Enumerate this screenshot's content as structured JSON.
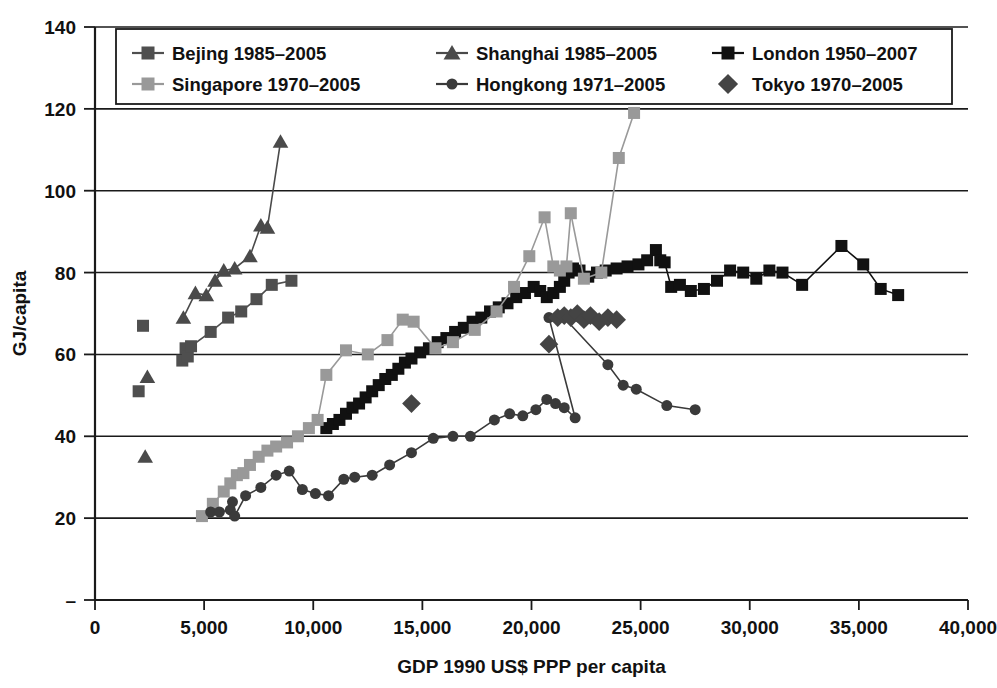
{
  "chart_data": {
    "type": "scatter",
    "title": "",
    "xlabel": "GDP 1990 US$ PPP per capita",
    "ylabel": "GJ/capita",
    "xlim": [
      0,
      40000
    ],
    "ylim": [
      0,
      140
    ],
    "xticks": [
      0,
      5000,
      10000,
      15000,
      20000,
      25000,
      30000,
      35000,
      40000
    ],
    "xticklabels": [
      "0",
      "5,000",
      "10,000",
      "15,000",
      "20,000",
      "25,000",
      "30,000",
      "35,000",
      "40,000"
    ],
    "yticks": [
      0,
      20,
      40,
      60,
      80,
      100,
      120,
      140
    ],
    "yticklabels": [
      "–",
      "20",
      "40",
      "60",
      "80",
      "100",
      "120",
      "140"
    ],
    "grid": "horizontal",
    "legend_position": "top-inside",
    "legend_columns": 3,
    "series": [
      {
        "name": "Bejing 1985–2005",
        "marker": "square",
        "color": "#4f4f4f",
        "line": true,
        "points": [
          [
            2000,
            51.0
          ],
          [
            2200,
            67.0
          ],
          [
            4000,
            58.5
          ],
          [
            4150,
            61.5
          ],
          [
            4250,
            59.5
          ],
          [
            4400,
            62.0
          ],
          [
            5300,
            65.5
          ],
          [
            6100,
            69.0
          ],
          [
            6700,
            70.5
          ],
          [
            7400,
            73.5
          ],
          [
            8100,
            77.0
          ],
          [
            9000,
            78.0
          ]
        ],
        "connected_from_index": 2
      },
      {
        "name": "Shanghai 1985–2005",
        "marker": "triangle",
        "color": "#4a4a4a",
        "line": true,
        "points": [
          [
            2300,
            35.0
          ],
          [
            2400,
            54.5
          ],
          [
            4050,
            69.0
          ],
          [
            4600,
            75.0
          ],
          [
            5100,
            74.5
          ],
          [
            5500,
            78.0
          ],
          [
            5900,
            80.5
          ],
          [
            6400,
            81.0
          ],
          [
            7100,
            84.0
          ],
          [
            7600,
            91.5
          ],
          [
            7900,
            91.0
          ],
          [
            8500,
            112.0
          ]
        ],
        "connected_from_index": 2
      },
      {
        "name": "London 1950–2007",
        "marker": "square",
        "color": "#111111",
        "line": true,
        "points": [
          [
            10600,
            42.0
          ],
          [
            10900,
            43.0
          ],
          [
            11200,
            44.0
          ],
          [
            11500,
            45.5
          ],
          [
            11800,
            47.0
          ],
          [
            12100,
            48.0
          ],
          [
            12400,
            49.5
          ],
          [
            12700,
            51.0
          ],
          [
            13000,
            52.5
          ],
          [
            13300,
            54.0
          ],
          [
            13600,
            55.0
          ],
          [
            13900,
            56.5
          ],
          [
            14200,
            58.0
          ],
          [
            14500,
            59.0
          ],
          [
            14900,
            60.5
          ],
          [
            15300,
            61.5
          ],
          [
            15700,
            63.0
          ],
          [
            16100,
            64.0
          ],
          [
            16500,
            65.5
          ],
          [
            16900,
            66.5
          ],
          [
            17300,
            68.0
          ],
          [
            17700,
            69.0
          ],
          [
            18100,
            70.5
          ],
          [
            18500,
            71.5
          ],
          [
            18900,
            72.5
          ],
          [
            19300,
            74.0
          ],
          [
            19700,
            75.0
          ],
          [
            20100,
            76.5
          ],
          [
            20400,
            75.5
          ],
          [
            20700,
            74.0
          ],
          [
            21000,
            75.0
          ],
          [
            21300,
            76.5
          ],
          [
            21500,
            78.0
          ],
          [
            21700,
            80.0
          ],
          [
            21900,
            81.0
          ],
          [
            22200,
            80.5
          ],
          [
            22600,
            79.0
          ],
          [
            23000,
            80.0
          ],
          [
            23400,
            80.5
          ],
          [
            23900,
            81.0
          ],
          [
            24400,
            81.5
          ],
          [
            24900,
            82.0
          ],
          [
            25300,
            83.0
          ],
          [
            25700,
            85.5
          ],
          [
            25900,
            83.0
          ],
          [
            26100,
            82.5
          ],
          [
            26400,
            76.5
          ],
          [
            26800,
            77.0
          ],
          [
            27300,
            75.5
          ],
          [
            27900,
            76.0
          ],
          [
            28500,
            78.0
          ],
          [
            29100,
            80.5
          ],
          [
            29700,
            80.0
          ],
          [
            30300,
            78.5
          ],
          [
            30900,
            80.5
          ],
          [
            31500,
            80.0
          ],
          [
            32400,
            77.0
          ],
          [
            34200,
            86.5
          ],
          [
            35200,
            82.0
          ],
          [
            36000,
            76.0
          ],
          [
            36800,
            74.5
          ]
        ]
      },
      {
        "name": "Singapore 1970–2005",
        "marker": "square",
        "color": "#999999",
        "line": true,
        "points": [
          [
            4900,
            20.5
          ],
          [
            5400,
            23.5
          ],
          [
            5900,
            26.5
          ],
          [
            6200,
            28.5
          ],
          [
            6500,
            30.5
          ],
          [
            6800,
            31.0
          ],
          [
            7100,
            33.0
          ],
          [
            7500,
            35.0
          ],
          [
            7900,
            36.5
          ],
          [
            8300,
            37.5
          ],
          [
            8800,
            38.5
          ],
          [
            9300,
            40.0
          ],
          [
            9800,
            42.0
          ],
          [
            10200,
            44.0
          ],
          [
            10600,
            55.0
          ],
          [
            11500,
            61.0
          ],
          [
            12500,
            60.0
          ],
          [
            13400,
            63.5
          ],
          [
            14100,
            68.5
          ],
          [
            14600,
            68.0
          ],
          [
            15600,
            61.5
          ],
          [
            16400,
            63.0
          ],
          [
            17400,
            66.0
          ],
          [
            18400,
            70.5
          ],
          [
            19200,
            76.5
          ],
          [
            19900,
            84.0
          ],
          [
            20600,
            93.5
          ],
          [
            21000,
            81.5
          ],
          [
            21300,
            80.5
          ],
          [
            21600,
            81.5
          ],
          [
            21800,
            94.5
          ],
          [
            22400,
            78.5
          ],
          [
            23200,
            80.0
          ],
          [
            24000,
            108.0
          ],
          [
            24700,
            119.0
          ]
        ]
      },
      {
        "name": "Hongkong 1971–2005",
        "marker": "circle",
        "color": "#3a3a3a",
        "line": true,
        "points": [
          [
            5300,
            21.5
          ],
          [
            5700,
            21.5
          ],
          [
            6200,
            22.0
          ],
          [
            6300,
            24.0
          ],
          [
            6400,
            20.5
          ],
          [
            6900,
            25.5
          ],
          [
            7600,
            27.5
          ],
          [
            8300,
            30.5
          ],
          [
            8900,
            31.5
          ],
          [
            9500,
            27.0
          ],
          [
            10100,
            26.0
          ],
          [
            10700,
            25.5
          ],
          [
            11400,
            29.5
          ],
          [
            11900,
            30.0
          ],
          [
            12700,
            30.5
          ],
          [
            13500,
            33.0
          ],
          [
            14500,
            36.0
          ],
          [
            15500,
            39.5
          ],
          [
            16400,
            40.0
          ],
          [
            17200,
            40.0
          ],
          [
            18300,
            44.0
          ],
          [
            19000,
            45.5
          ],
          [
            19600,
            45.0
          ],
          [
            20200,
            46.5
          ],
          [
            20700,
            49.0
          ],
          [
            21100,
            48.0
          ],
          [
            21500,
            47.0
          ],
          [
            22000,
            44.5
          ],
          [
            20800,
            69.0
          ],
          [
            21400,
            69.5
          ],
          [
            23500,
            57.5
          ],
          [
            24200,
            52.5
          ],
          [
            24800,
            51.5
          ],
          [
            26200,
            47.5
          ],
          [
            27500,
            46.5
          ]
        ]
      },
      {
        "name": "Tokyo 1970–2005",
        "marker": "diamond",
        "color": "#444444",
        "line": false,
        "points": [
          [
            14500,
            48.0
          ],
          [
            20800,
            62.5
          ],
          [
            21200,
            69.0
          ],
          [
            21500,
            69.5
          ],
          [
            21800,
            69.0
          ],
          [
            22100,
            70.0
          ],
          [
            22400,
            68.5
          ],
          [
            22700,
            69.5
          ],
          [
            23100,
            68.0
          ],
          [
            23500,
            69.0
          ],
          [
            23900,
            68.5
          ]
        ]
      }
    ]
  },
  "legend": {
    "entries": [
      {
        "label": "Bejing 1985–2005",
        "marker": "square",
        "color": "#4f4f4f",
        "line": true
      },
      {
        "label": "Shanghai 1985–2005",
        "marker": "triangle",
        "color": "#4a4a4a",
        "line": true
      },
      {
        "label": "London 1950–2007",
        "marker": "square",
        "color": "#111111",
        "line": true
      },
      {
        "label": "Singapore 1970–2005",
        "marker": "square",
        "color": "#999999",
        "line": true
      },
      {
        "label": "Hongkong 1971–2005",
        "marker": "circle",
        "color": "#3a3a3a",
        "line": true
      },
      {
        "label": "Tokyo 1970–2005",
        "marker": "diamond",
        "color": "#444444",
        "line": false
      }
    ]
  },
  "colors": {
    "axis": "#1a1a1a",
    "background": "#ffffff",
    "beijing": "#4f4f4f",
    "shanghai": "#4a4a4a",
    "london": "#111111",
    "singapore": "#999999",
    "hongkong": "#3a3a3a",
    "tokyo": "#444444"
  }
}
